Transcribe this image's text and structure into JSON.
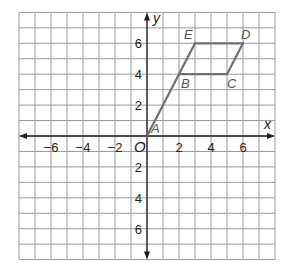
{
  "diagram": {
    "type": "coordinate-plane",
    "axes": {
      "x_label": "x",
      "y_label": "y",
      "origin_label": "O",
      "x_range": [
        -8,
        8
      ],
      "y_range": [
        -8,
        8
      ],
      "x_ticks": [
        {
          "value": -6,
          "label": "−6"
        },
        {
          "value": -4,
          "label": "−4"
        },
        {
          "value": -2,
          "label": "−2"
        },
        {
          "value": 2,
          "label": "2"
        },
        {
          "value": 4,
          "label": "4"
        },
        {
          "value": 6,
          "label": "6"
        }
      ],
      "y_ticks": [
        {
          "value": 6,
          "label": "6"
        },
        {
          "value": 4,
          "label": "4"
        },
        {
          "value": 2,
          "label": "2"
        },
        {
          "value": -2,
          "label": "2"
        },
        {
          "value": -4,
          "label": "4"
        },
        {
          "value": -6,
          "label": "6"
        }
      ]
    },
    "points": [
      {
        "name": "A",
        "x": 0,
        "y": 0
      },
      {
        "name": "B",
        "x": 2,
        "y": 4
      },
      {
        "name": "C",
        "x": 5,
        "y": 4
      },
      {
        "name": "D",
        "x": 6,
        "y": 6
      },
      {
        "name": "E",
        "x": 3,
        "y": 6
      }
    ],
    "segments": [
      [
        "A",
        "E"
      ],
      [
        "B",
        "C"
      ],
      [
        "C",
        "D"
      ],
      [
        "D",
        "E"
      ]
    ],
    "colors": {
      "grid": "#9a9a9a",
      "axis": "#231f20",
      "figure": "#707070",
      "point_label": "#555555"
    }
  }
}
